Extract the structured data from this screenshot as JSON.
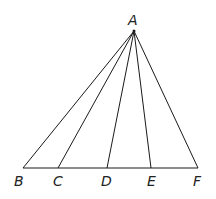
{
  "diagram": {
    "type": "geometry",
    "points": {
      "A": {
        "label": "A",
        "x": 134,
        "y": 31
      },
      "B": {
        "label": "B",
        "x": 23,
        "y": 168
      },
      "C": {
        "label": "C",
        "x": 58,
        "y": 168
      },
      "D": {
        "label": "D",
        "x": 107,
        "y": 168
      },
      "E": {
        "label": "E",
        "x": 151,
        "y": 168
      },
      "F": {
        "label": "F",
        "x": 198,
        "y": 168
      }
    },
    "segments": [
      [
        "A",
        "B"
      ],
      [
        "A",
        "C"
      ],
      [
        "A",
        "D"
      ],
      [
        "A",
        "E"
      ],
      [
        "A",
        "F"
      ],
      [
        "B",
        "F"
      ]
    ],
    "labels": {
      "A": "A",
      "B": "B",
      "C": "C",
      "D": "D",
      "E": "E",
      "F": "F"
    },
    "colors": {
      "line": "#1a1a1a",
      "text": "#222222",
      "background": "#ffffff"
    }
  }
}
